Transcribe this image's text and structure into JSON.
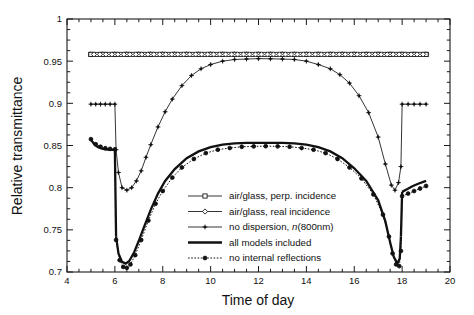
{
  "figure": {
    "kind": "scientific-line-plot",
    "background": "#ffffff",
    "ink_color": "#111111"
  },
  "chart_data": {
    "type": "line",
    "title": "",
    "subtitle": "",
    "xlabel": "Time of day",
    "ylabel": "Relative transmittance",
    "xlim": [
      4,
      20
    ],
    "ylim": [
      0.7,
      1.0
    ],
    "xticks": [
      4,
      6,
      8,
      10,
      12,
      14,
      16,
      18,
      20
    ],
    "xtick_labels": [
      "4",
      "6",
      "8",
      "10",
      "12",
      "14",
      "16",
      "18",
      "20"
    ],
    "yticks": [
      0.7,
      0.75,
      0.8,
      0.85,
      0.9,
      0.95,
      1
    ],
    "ytick_labels": [
      "0.7",
      "0.75",
      "0.8",
      "0.85",
      "0.9",
      "0.95",
      "1"
    ],
    "x_minor_tick_step": 0.5,
    "y_minor_tick_step": 0.0125,
    "grid": false,
    "legend_position": "center-bottom-inside",
    "annotations": [],
    "series": [
      {
        "name": "air/glass, perp. incidence",
        "marker": "open-square",
        "line_style": "solid-thin",
        "x": [
          5,
          5.5,
          6,
          6.5,
          7,
          7.5,
          8,
          8.5,
          9,
          9.5,
          10,
          10.5,
          11,
          11.5,
          12,
          12.5,
          13,
          13.5,
          14,
          14.5,
          15,
          15.5,
          16,
          16.5,
          17,
          17.5,
          18,
          18.5,
          19
        ],
        "values": [
          0.958,
          0.958,
          0.958,
          0.958,
          0.958,
          0.958,
          0.958,
          0.958,
          0.958,
          0.958,
          0.958,
          0.958,
          0.958,
          0.958,
          0.958,
          0.958,
          0.958,
          0.958,
          0.958,
          0.958,
          0.958,
          0.958,
          0.958,
          0.958,
          0.958,
          0.958,
          0.958,
          0.958,
          0.958
        ]
      },
      {
        "name": "air/glass, real incidence",
        "marker": "open-diamond",
        "line_style": "solid-thin",
        "x": [
          5,
          5.5,
          6,
          6.5,
          7,
          7.5,
          8,
          8.5,
          9,
          9.5,
          10,
          10.5,
          11,
          11.5,
          12,
          12.5,
          13,
          13.5,
          14,
          14.5,
          15,
          15.5,
          16,
          16.5,
          17,
          17.5,
          18,
          18.5,
          19
        ],
        "values": [
          0.958,
          0.958,
          0.958,
          0.958,
          0.958,
          0.958,
          0.958,
          0.958,
          0.958,
          0.958,
          0.958,
          0.958,
          0.958,
          0.958,
          0.958,
          0.958,
          0.958,
          0.958,
          0.958,
          0.958,
          0.958,
          0.958,
          0.958,
          0.958,
          0.958,
          0.958,
          0.958,
          0.958,
          0.958
        ]
      },
      {
        "name": "no dispersion, n(800nm)",
        "marker": "filled-plus",
        "line_style": "solid-thin",
        "segments": [
          {
            "x": [
              5.0,
              5.2,
              5.4,
              5.6,
              5.8,
              6.0
            ],
            "values": [
              0.899,
              0.899,
              0.899,
              0.899,
              0.899,
              0.899
            ]
          },
          {
            "x": [
              6.05,
              6.15,
              6.3,
              6.5,
              6.7,
              6.9,
              7.1,
              7.3,
              7.5,
              7.8,
              8.1,
              8.4,
              8.8,
              9.2,
              9.6,
              10.0,
              10.5,
              11.0,
              11.5,
              12.0,
              12.5,
              13.0,
              13.5,
              14.0,
              14.5,
              15.0,
              15.4,
              15.8,
              16.2,
              16.6,
              17.0,
              17.3,
              17.55,
              17.7,
              17.85,
              17.95
            ],
            "values": [
              0.845,
              0.818,
              0.8,
              0.797,
              0.8,
              0.808,
              0.82,
              0.836,
              0.851,
              0.872,
              0.89,
              0.905,
              0.921,
              0.933,
              0.941,
              0.946,
              0.95,
              0.952,
              0.9525,
              0.953,
              0.9528,
              0.9525,
              0.952,
              0.95,
              0.946,
              0.941,
              0.934,
              0.924,
              0.909,
              0.889,
              0.86,
              0.828,
              0.803,
              0.797,
              0.806,
              0.825
            ]
          },
          {
            "x": [
              18.0,
              18.25,
              18.5,
              18.75,
              19.0
            ],
            "values": [
              0.899,
              0.899,
              0.899,
              0.899,
              0.899
            ]
          }
        ]
      },
      {
        "name": "all models included",
        "marker": "none",
        "line_style": "solid-bold",
        "segments": [
          {
            "x": [
              5.0,
              5.15,
              5.3,
              5.5,
              5.7,
              5.9,
              6.0
            ],
            "values": [
              0.857,
              0.851,
              0.848,
              0.846,
              0.845,
              0.8448,
              0.8447
            ]
          },
          {
            "x": [
              6.05,
              6.15,
              6.3,
              6.45,
              6.6,
              6.8,
              7.0,
              7.2,
              7.5,
              7.8,
              8.1,
              8.5,
              9.0,
              9.5,
              10.0,
              10.5,
              11.0,
              11.5,
              12.0,
              12.5,
              13.0,
              13.5,
              14.0,
              14.5,
              15.0,
              15.5,
              16.0,
              16.5,
              17.0,
              17.3,
              17.5,
              17.65,
              17.8,
              17.9,
              17.95
            ],
            "values": [
              0.742,
              0.722,
              0.712,
              0.71,
              0.713,
              0.723,
              0.737,
              0.752,
              0.774,
              0.793,
              0.808,
              0.822,
              0.835,
              0.843,
              0.848,
              0.851,
              0.8525,
              0.853,
              0.8532,
              0.8532,
              0.853,
              0.8525,
              0.851,
              0.848,
              0.843,
              0.835,
              0.823,
              0.808,
              0.785,
              0.76,
              0.735,
              0.718,
              0.71,
              0.716,
              0.742
            ]
          },
          {
            "x": [
              18.0,
              18.2,
              18.45,
              18.7,
              19.0
            ],
            "values": [
              0.795,
              0.798,
              0.802,
              0.805,
              0.808
            ]
          }
        ]
      },
      {
        "name": "no internal reflections",
        "marker": "filled-circle",
        "line_style": "dotted",
        "segments": [
          {
            "x": [
              5.0,
              5.2,
              5.4,
              5.6,
              5.8,
              6.0
            ],
            "values": [
              0.8575,
              0.8515,
              0.8485,
              0.8468,
              0.846,
              0.8455
            ]
          },
          {
            "x": [
              6.05,
              6.2,
              6.35,
              6.5,
              6.65,
              6.85,
              7.1,
              7.4,
              7.7,
              8.0,
              8.4,
              8.8,
              9.3,
              9.8,
              10.3,
              10.8,
              11.3,
              11.8,
              12.3,
              12.8,
              13.3,
              13.8,
              14.3,
              14.8,
              15.3,
              15.8,
              16.3,
              16.8,
              17.2,
              17.45,
              17.6,
              17.75,
              17.88,
              17.95
            ],
            "values": [
              0.738,
              0.714,
              0.706,
              0.705,
              0.709,
              0.72,
              0.738,
              0.761,
              0.781,
              0.796,
              0.812,
              0.824,
              0.834,
              0.841,
              0.845,
              0.847,
              0.8485,
              0.849,
              0.8492,
              0.849,
              0.8485,
              0.847,
              0.845,
              0.841,
              0.834,
              0.824,
              0.811,
              0.792,
              0.768,
              0.742,
              0.722,
              0.709,
              0.707,
              0.725
            ]
          },
          {
            "x": [
              18.0,
              18.25,
              18.5,
              18.75,
              19.0
            ],
            "values": [
              0.79,
              0.793,
              0.796,
              0.799,
              0.802
            ]
          }
        ]
      }
    ],
    "legend_entries": [
      {
        "label": "air/glass, perp. incidence",
        "marker": "open-square",
        "style": "solid-thin"
      },
      {
        "label": "air/glass, real incidence",
        "marker": "open-diamond",
        "style": "solid-thin"
      },
      {
        "label": "no dispersion, n(800nm)",
        "label_plain": "no dispersion, ",
        "label_italic": "n",
        "label_tail": "(800nm)",
        "marker": "filled-plus",
        "style": "solid-thin"
      },
      {
        "label": "all models included",
        "marker": "none",
        "style": "solid-bold"
      },
      {
        "label": "no internal reflections",
        "marker": "filled-circle",
        "style": "dotted"
      }
    ]
  }
}
